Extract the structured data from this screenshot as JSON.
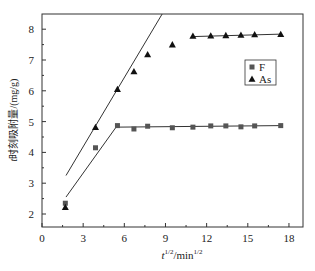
{
  "chart_data": {
    "type": "scatter",
    "title": "",
    "xlabel": "t^1/2/min^1/2",
    "xlabel_parts": {
      "base": "t",
      "sup1": "1/2",
      "mid": "/min",
      "sup2": "1/2"
    },
    "ylabel": "t时刻吸附量/(mg/g)",
    "xlim": [
      0,
      19
    ],
    "ylim": [
      1.5,
      8.6
    ],
    "xticks": [
      0,
      3,
      6,
      9,
      12,
      15,
      18
    ],
    "yticks": [
      2,
      3,
      4,
      5,
      6,
      7,
      8
    ],
    "grid": false,
    "legend_position": "upper right (inside)",
    "series": [
      {
        "name": "F",
        "marker": "square",
        "color": "#555555",
        "x": [
          1.7,
          3.9,
          5.5,
          6.7,
          7.7,
          9.5,
          11.0,
          12.3,
          13.4,
          14.5,
          15.5,
          17.4
        ],
        "y": [
          2.35,
          4.15,
          4.87,
          4.76,
          4.85,
          4.8,
          4.82,
          4.86,
          4.86,
          4.83,
          4.86,
          4.87
        ]
      },
      {
        "name": "As",
        "marker": "triangle",
        "color": "#111111",
        "x": [
          1.7,
          3.9,
          5.5,
          6.7,
          7.7,
          9.5,
          11.0,
          12.3,
          13.4,
          14.5,
          15.5,
          17.4
        ],
        "y": [
          2.22,
          4.82,
          6.05,
          6.63,
          7.18,
          7.5,
          7.78,
          7.79,
          7.8,
          7.81,
          7.83,
          7.84
        ]
      }
    ],
    "fit_lines": [
      {
        "series": "F",
        "segments": [
          [
            [
              1.75,
              2.55
            ],
            [
              5.4,
              4.82
            ]
          ],
          [
            [
              5.4,
              4.82
            ],
            [
              17.4,
              4.87
            ]
          ]
        ]
      },
      {
        "series": "As",
        "segments": [
          [
            [
              1.75,
              3.25
            ],
            [
              8.9,
              8.6
            ]
          ],
          [
            [
              11.0,
              7.76
            ],
            [
              17.4,
              7.84
            ]
          ]
        ]
      }
    ]
  }
}
